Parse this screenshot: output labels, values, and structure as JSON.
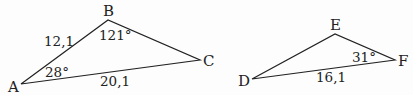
{
  "triangle_abc": {
    "vertices": {
      "A": "A",
      "B": "B",
      "C": "C"
    },
    "side_ab": "12,1",
    "side_ac": "20,1",
    "angle_a": "28°",
    "angle_b": "121°"
  },
  "triangle_def": {
    "vertices": {
      "D": "D",
      "E": "E",
      "F": "F"
    },
    "side_df": "16,1",
    "angle_f": "31°"
  },
  "colors": {
    "stroke": "#222222",
    "background": "#fdfdfd"
  }
}
